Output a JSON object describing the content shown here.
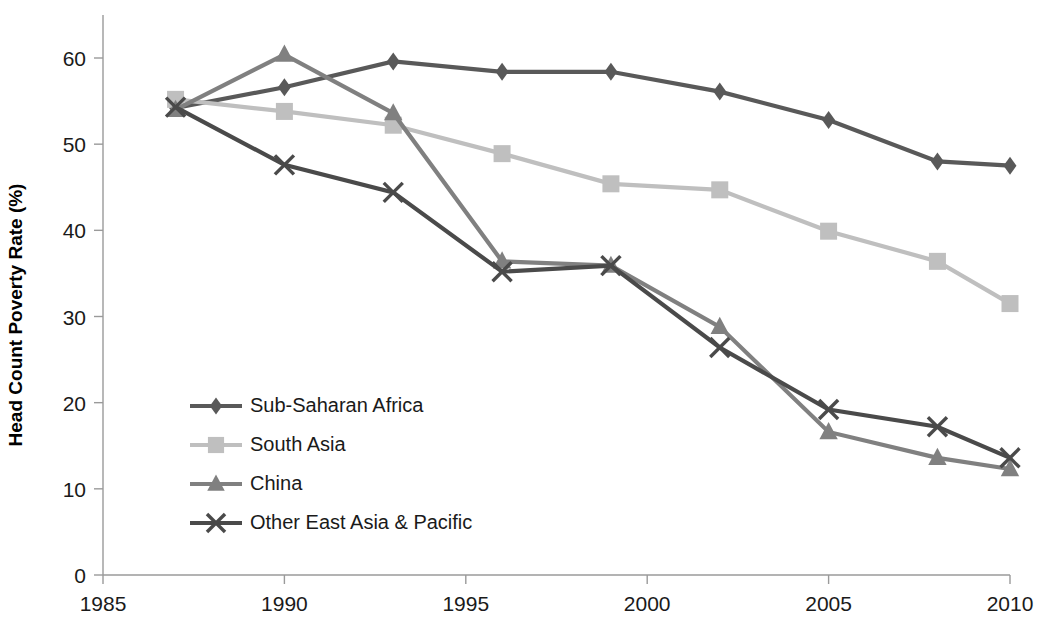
{
  "chart_data": {
    "type": "line",
    "title": "",
    "xlabel": "",
    "ylabel": "Head Count Poverty Rate (%)",
    "xlim": [
      1985,
      2010
    ],
    "ylim": [
      0,
      65
    ],
    "xticks": [
      1985,
      1990,
      1995,
      2000,
      2005,
      2010
    ],
    "yticks": [
      0,
      10,
      20,
      30,
      40,
      50,
      60
    ],
    "grid": false,
    "legend_position": "inside-lower-left",
    "x": [
      1987,
      1990,
      1993,
      1996,
      1999,
      2002,
      2005,
      2008,
      2010
    ],
    "series": [
      {
        "name": "Sub-Saharan Africa",
        "marker": "diamond",
        "color": "#595959",
        "values": [
          54.2,
          56.6,
          59.6,
          58.4,
          58.4,
          56.1,
          52.8,
          48.0,
          47.5
        ]
      },
      {
        "name": "South Asia",
        "marker": "square",
        "color": "#bfbfbf",
        "values": [
          55.2,
          53.8,
          52.2,
          48.9,
          45.4,
          44.7,
          39.9,
          36.4,
          31.5
        ]
      },
      {
        "name": "China",
        "marker": "triangle",
        "color": "#808080",
        "values": [
          54.0,
          60.4,
          53.6,
          36.4,
          35.9,
          28.8,
          16.6,
          13.6,
          12.3
        ]
      },
      {
        "name": "Other East Asia & Pacific",
        "marker": "cross",
        "color": "#4a4a4a",
        "values": [
          54.3,
          47.6,
          44.4,
          35.2,
          35.9,
          26.4,
          19.2,
          17.2,
          13.6
        ]
      }
    ]
  },
  "axis": {
    "y_title": "Head Count Poverty Rate (%)",
    "y_tick_labels": [
      "0",
      "10",
      "20",
      "30",
      "40",
      "50",
      "60"
    ],
    "x_tick_labels": [
      "1985",
      "1990",
      "1995",
      "2000",
      "2005",
      "2010"
    ]
  },
  "legend": {
    "items": [
      {
        "label": "Sub-Saharan Africa"
      },
      {
        "label": "South Asia"
      },
      {
        "label": "China"
      },
      {
        "label": "Other East Asia & Pacific"
      }
    ]
  }
}
